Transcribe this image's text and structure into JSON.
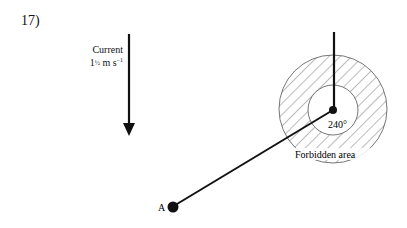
{
  "question": {
    "number": "17)"
  },
  "current": {
    "label": "Current",
    "speed_whole": "1",
    "speed_fraction": "½",
    "speed_unit": "m s",
    "speed_unit_exp": "−1",
    "direction": "down"
  },
  "diagram": {
    "point_a_label": "A",
    "angle_label": "240°",
    "forbidden_label": "Forbidden area",
    "colors": {
      "line": "#111111",
      "hatch": "#555555",
      "circle_stroke": "#666666"
    }
  }
}
